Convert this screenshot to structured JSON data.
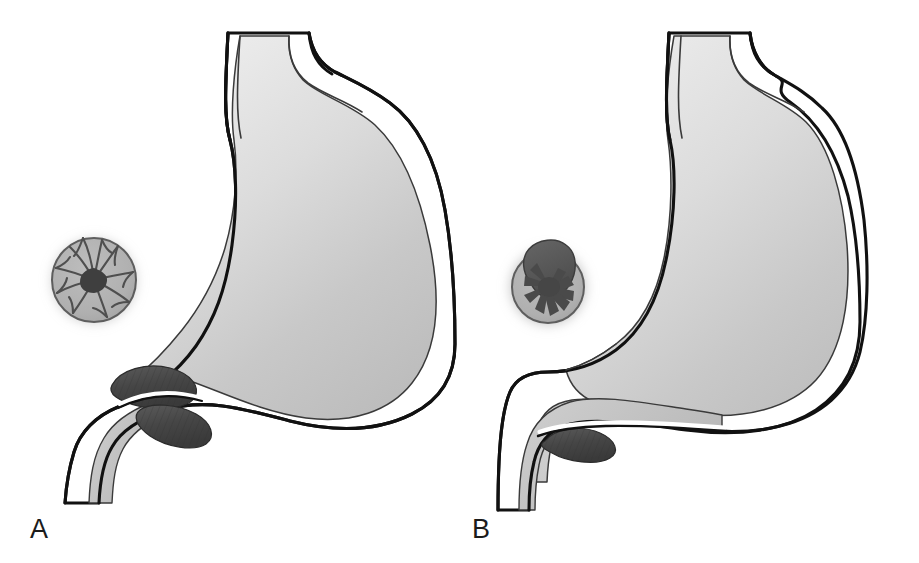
{
  "figure": {
    "background_color": "#ffffff",
    "width": 919,
    "height": 563,
    "style": "grayscale medical line illustration, two panels"
  },
  "palette": {
    "outline_dark": "#111111",
    "outline_thin": "#3a3a3a",
    "wall_white": "#ffffff",
    "lumen_light": "#ececec",
    "lumen_mid": "#c9c9c9",
    "lumen_dark": "#b4b4b4",
    "duodenum_fill": "#bdbdbd",
    "sphincter_dark": "#4b4b4b",
    "sphincter_darker": "#3b3b3b",
    "inset_disc_fill": "#b0b0b0",
    "inset_disc_edge": "#5e5e5e",
    "inset_halo": "#9a9a9a",
    "mucosa_fold": "#5a5a5a",
    "lesion_dark": "#4f4f4f",
    "lesion_mass": "#585858",
    "label_color": "#1b1b1b"
  },
  "panels": [
    {
      "id": "A",
      "label": "A",
      "label_x": 30,
      "label_y": 538,
      "organ": "stomach",
      "description": "Stomach with esophagus, narrowed pylorus and duodenum",
      "inset": {
        "name": "mucosa-inset-a",
        "center_x": 94,
        "center_y": 280,
        "radius": 42,
        "content": "stellate radiating mucosal folds converging to a central scar",
        "fold_count": 10,
        "has_central_mass": false
      },
      "pylorus": {
        "state": "narrowed",
        "center_x": 90,
        "center_y": 405,
        "shading": "dark striated muscular ring"
      },
      "duodenum": {
        "state": "normal caliber",
        "outlet_x": 60,
        "outlet_y": 500
      }
    },
    {
      "id": "B",
      "label": "B",
      "label_x": 472,
      "label_y": 538,
      "organ": "stomach",
      "description": "Stomach with dilated antrum, open pylorus and ulcerated mass",
      "inset": {
        "name": "mucosa-inset-b",
        "center_x": 548,
        "center_y": 285,
        "radius": 37,
        "content": "stellate mucosal folds with a large dark ulcerated mass protruding superiorly",
        "fold_count": 9,
        "has_central_mass": true
      },
      "pylorus": {
        "state": "patent / widened",
        "center_x": 565,
        "center_y": 455,
        "shading": "small dark striated band"
      },
      "duodenum": {
        "state": "dilated proximal segment",
        "outlet_x": 520,
        "outlet_y": 510
      }
    }
  ],
  "labels": {
    "panel_a": "A",
    "panel_b": "B"
  }
}
